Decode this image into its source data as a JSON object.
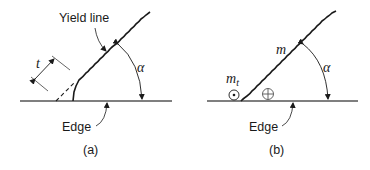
{
  "panels": [
    {
      "id": "a",
      "caption": "(a)",
      "yield_line_label": "Yield line",
      "edge_label": "Edge",
      "thickness_label": "t",
      "angle_label": "α"
    },
    {
      "id": "b",
      "caption": "(b)",
      "moment_label": "m",
      "twist_moment_label": "m",
      "twist_moment_subscript": "t",
      "edge_label": "Edge",
      "angle_label": "α",
      "symbols": [
        "dot-circle-icon",
        "plus-circle-icon"
      ]
    }
  ],
  "colors": {
    "line": "#1a1a1a",
    "edge": "#555555"
  }
}
